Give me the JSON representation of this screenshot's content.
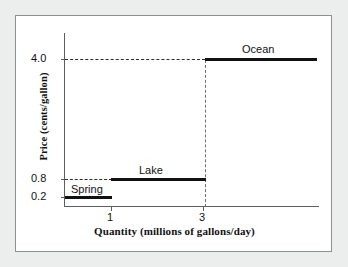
{
  "figure": {
    "background_color": "#eceded",
    "panel_color": "#ffffff",
    "border_color": "#8d8f90",
    "line_color": "#111111"
  },
  "chart_data": {
    "type": "line",
    "title": "",
    "subtitle": "",
    "xlabel": "Quantity (millions of gallons/day)",
    "ylabel": "Price (cents/gallon)",
    "xlim": [
      0,
      5.5
    ],
    "ylim": [
      0,
      4.6
    ],
    "grid": false,
    "legend_position": "inline-annotations",
    "xticks": [
      "1",
      "3"
    ],
    "xtick_values": [
      1,
      3
    ],
    "yticks": [
      "4.0",
      "0.8",
      "0.2"
    ],
    "ytick_values": [
      4.0,
      0.8,
      0.2
    ],
    "step_style": "horizontal-segments-with-vertical-jump",
    "series": [
      {
        "name": "Spring",
        "price": 0.2,
        "quantity_start": 0,
        "quantity_end": 1,
        "label": "Spring"
      },
      {
        "name": "Lake",
        "price": 0.8,
        "quantity_start": 1,
        "quantity_end": 3,
        "label": "Lake"
      },
      {
        "name": "Ocean",
        "price": 4.0,
        "quantity_start": 3,
        "quantity_end": 5.4,
        "label": "Ocean"
      }
    ],
    "x": [
      0,
      1,
      1,
      3,
      3,
      5.4
    ],
    "y": [
      0.2,
      0.2,
      0.8,
      0.8,
      4.0,
      4.0
    ],
    "annotations": [
      {
        "text": "Spring",
        "x": 0.45,
        "y": 0.5
      },
      {
        "text": "Lake",
        "x": 1.9,
        "y": 1.2
      },
      {
        "text": "Ocean",
        "x": 4.0,
        "y": 4.45
      }
    ],
    "guides": [
      {
        "type": "horizontal-dashed",
        "value": 4.0,
        "from_x": 0,
        "to_x": 3
      },
      {
        "type": "horizontal-dashed",
        "value": 0.8,
        "from_x": 0,
        "to_x": 1
      },
      {
        "type": "vertical-dashed",
        "value": 3,
        "from_y": 0,
        "to_y": 4.0
      }
    ]
  },
  "labels": {
    "y_tick_40": "4.0",
    "y_tick_08": "0.8",
    "y_tick_02": "0.2",
    "x_tick_1": "1",
    "x_tick_3": "3",
    "spring": "Spring",
    "lake": "Lake",
    "ocean": "Ocean",
    "y_axis_title": "Price (cents/gallon)",
    "x_axis_title": "Quantity (millions of gallons/day)"
  }
}
